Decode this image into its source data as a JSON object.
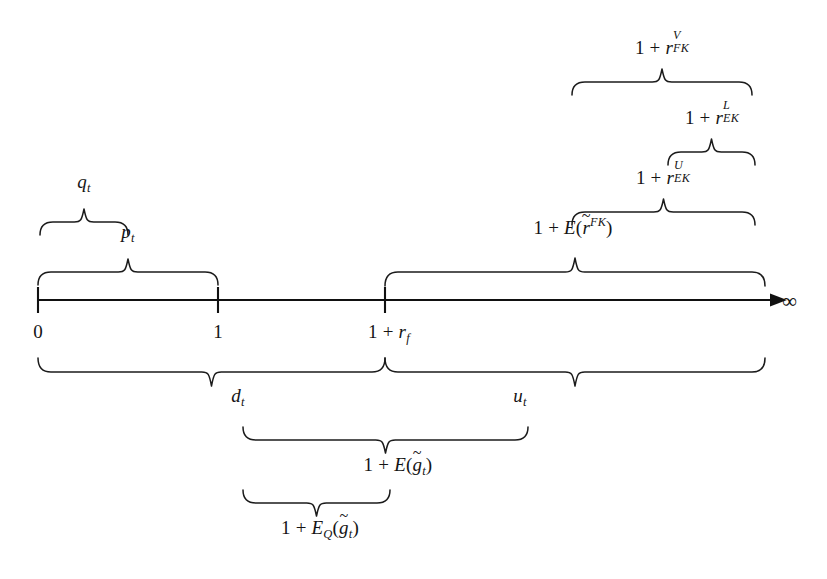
{
  "figure": {
    "kind": "number-line-diagram",
    "background_color": "#ffffff",
    "ink_color": "#141414"
  },
  "axis": {
    "name": "value-axis",
    "start_x": 38,
    "end_x": 765,
    "y": 300,
    "arrow_label": "∞",
    "ticks": [
      {
        "id": "tick-zero",
        "x": 38,
        "label_plain": "0"
      },
      {
        "id": "tick-one",
        "x": 218,
        "label_plain": "1"
      },
      {
        "id": "tick-one-plus-rf",
        "x": 385,
        "label_plain": "1 + rf"
      }
    ]
  },
  "labels": {
    "zero": "0",
    "one": "1",
    "one_plus_rf_lead": "1 + ",
    "r_symbol": "r",
    "rf_sub": "f",
    "infinity": "∞",
    "q_base": "q",
    "q_sub": "t",
    "p_base": "p",
    "p_sub": "t",
    "d_base": "d",
    "d_sub": "t",
    "u_base": "u",
    "u_sub": "t",
    "one_plus": "1 + ",
    "r_FK_sub": "FK",
    "r_FK_sup": "V",
    "r_EK_sub": "EK",
    "r_EK_sup_L": "L",
    "r_EK_sup_U": "U",
    "E_symbol": "E",
    "E_sub_Q": "Q",
    "paren_open": "(",
    "paren_close": ")",
    "tilde": "~",
    "r_tilde_base": "r",
    "r_tilde_sup": "FK",
    "g_tilde_base": "g",
    "g_tilde_sub": "t"
  },
  "braces": [
    {
      "id": "brace-q-t",
      "label_id": "label-q-t",
      "label_text": "q_t",
      "direction": "down",
      "x_left": 40,
      "x_right": 128,
      "y": 222,
      "depth": 13,
      "label_x": 84,
      "label_y": 176
    },
    {
      "id": "brace-p-t",
      "label_id": "label-p-t",
      "label_text": "p_t",
      "direction": "down",
      "x_left": 38,
      "x_right": 218,
      "y": 272,
      "depth": 13,
      "label_x": 128,
      "label_y": 226
    },
    {
      "id": "brace-one-plus-E-r-tilde-FK",
      "label_id": "label-one-plus-E-r-tilde-FK",
      "label_text": "1 + E(r̃^FK)",
      "direction": "down",
      "x_left": 385,
      "x_right": 765,
      "y": 272,
      "depth": 14,
      "label_x": 575,
      "label_y": 222
    },
    {
      "id": "brace-one-plus-r-EK-U",
      "label_id": "label-one-plus-r-EK-U",
      "label_text": "1 + r_EK^U",
      "direction": "down",
      "x_left": 572,
      "x_right": 755,
      "y": 212,
      "depth": 13,
      "label_x": 663,
      "label_y": 166
    },
    {
      "id": "brace-one-plus-r-EK-L",
      "label_id": "label-one-plus-r-EK-L",
      "label_text": "1 + r_EK^L",
      "direction": "down",
      "x_left": 668,
      "x_right": 755,
      "y": 152,
      "depth": 13,
      "label_x": 712,
      "label_y": 106
    },
    {
      "id": "brace-one-plus-r-FK-V",
      "label_id": "label-one-plus-r-FK-V",
      "label_text": "1 + r_FK^V",
      "direction": "down",
      "x_left": 572,
      "x_right": 752,
      "y": 82,
      "depth": 13,
      "label_x": 662,
      "label_y": 36
    },
    {
      "id": "brace-d-t",
      "label_id": "label-d-t",
      "label_text": "d_t",
      "direction": "up",
      "x_left": 38,
      "x_right": 385,
      "y": 372,
      "depth": 14,
      "label_x": 238,
      "label_y": 388
    },
    {
      "id": "brace-u-t",
      "label_id": "label-u-t",
      "label_text": "u_t",
      "direction": "up",
      "x_left": 385,
      "x_right": 765,
      "y": 372,
      "depth": 14,
      "label_x": 520,
      "label_y": 388
    },
    {
      "id": "brace-one-plus-E-g-tilde",
      "label_id": "label-one-plus-E-g-tilde",
      "label_text": "1 + E(g̃_t)",
      "direction": "up",
      "x_left": 243,
      "x_right": 528,
      "y": 440,
      "depth": 13,
      "label_x": 398,
      "label_y": 457
    },
    {
      "id": "brace-one-plus-E-Q-g-tilde",
      "label_id": "label-one-plus-E-Q-g-tilde",
      "label_text": "1 + E_Q(g̃_t)",
      "direction": "up",
      "x_left": 243,
      "x_right": 390,
      "y": 503,
      "depth": 13,
      "label_x": 320,
      "label_y": 520
    }
  ]
}
